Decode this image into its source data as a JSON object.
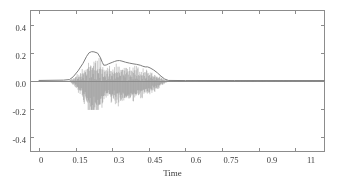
{
  "figure": {
    "background_color": "#ffffff",
    "frame_color": "#8c8c8c",
    "waveform_color": "#8a8a8a",
    "envelope_color": "#7d7d7d"
  },
  "chart_data": {
    "type": "line",
    "title": "",
    "subtitle": "",
    "xlabel": "Time",
    "ylabel": "",
    "grid": false,
    "legend": "none",
    "xlim": [
      -0.035,
      1.17
    ],
    "ylim": [
      -0.5,
      0.5
    ],
    "xticks": [
      0,
      0.15,
      0.3,
      0.45,
      0.6,
      0.75,
      0.9,
      1.05
    ],
    "xtick_labels": [
      "0",
      "0.15",
      "0.3",
      "0.45",
      "0.6",
      "0.75",
      "0.9",
      "11"
    ],
    "yticks": [
      -0.4,
      -0.2,
      0.0,
      0.2,
      0.4
    ],
    "ytick_labels": [
      "-0.4",
      "-0.2",
      "0.0",
      "0.2",
      "0.4"
    ],
    "annotations": [],
    "series": [
      {
        "name": "waveform",
        "kind": "oscillation",
        "description": "dense audio waveform oscillating about zero, active 0.12s-0.53s, silent elsewhere",
        "sample_rate_hz": 2400,
        "max_positive": 0.21,
        "max_negative": -0.205,
        "onset": 0.125,
        "offset": 0.53,
        "envelope_x": [
          0.0,
          0.1,
          0.125,
          0.14,
          0.16,
          0.18,
          0.195,
          0.205,
          0.215,
          0.225,
          0.24,
          0.25,
          0.26,
          0.265,
          0.275,
          0.285,
          0.3,
          0.31,
          0.32,
          0.33,
          0.34,
          0.355,
          0.37,
          0.385,
          0.4,
          0.415,
          0.425,
          0.435,
          0.445,
          0.455,
          0.47,
          0.485,
          0.5,
          0.515,
          0.53,
          0.6,
          0.8,
          1.0,
          1.17
        ],
        "envelope_y": [
          0.004,
          0.006,
          0.01,
          0.03,
          0.072,
          0.125,
          0.175,
          0.2,
          0.208,
          0.207,
          0.198,
          0.17,
          0.13,
          0.112,
          0.113,
          0.122,
          0.132,
          0.139,
          0.144,
          0.145,
          0.141,
          0.133,
          0.127,
          0.122,
          0.118,
          0.112,
          0.105,
          0.1,
          0.1,
          0.093,
          0.078,
          0.058,
          0.034,
          0.014,
          0.004,
          0.003,
          0.003,
          0.003,
          0.003
        ]
      },
      {
        "name": "amplitude-envelope",
        "kind": "line",
        "description": "smooth upper amplitude envelope traced over the waveform",
        "x": [
          0.0,
          0.1,
          0.125,
          0.14,
          0.16,
          0.18,
          0.195,
          0.205,
          0.215,
          0.225,
          0.24,
          0.25,
          0.26,
          0.265,
          0.275,
          0.285,
          0.3,
          0.31,
          0.32,
          0.33,
          0.34,
          0.355,
          0.37,
          0.385,
          0.4,
          0.415,
          0.425,
          0.435,
          0.445,
          0.455,
          0.47,
          0.485,
          0.5,
          0.515,
          0.53,
          0.6,
          0.8,
          1.0,
          1.17
        ],
        "y": [
          0.004,
          0.006,
          0.01,
          0.03,
          0.072,
          0.125,
          0.175,
          0.2,
          0.208,
          0.207,
          0.198,
          0.17,
          0.13,
          0.112,
          0.113,
          0.122,
          0.132,
          0.139,
          0.144,
          0.145,
          0.141,
          0.133,
          0.127,
          0.122,
          0.118,
          0.112,
          0.105,
          0.1,
          0.1,
          0.093,
          0.078,
          0.058,
          0.034,
          0.014,
          0.004,
          0.003,
          0.003,
          0.003,
          0.003
        ],
        "peaks": [
          {
            "x": 0.215,
            "y": 0.208
          },
          {
            "x": 0.33,
            "y": 0.145
          }
        ],
        "valleys": [
          {
            "x": 0.265,
            "y": 0.112
          }
        ]
      }
    ]
  }
}
